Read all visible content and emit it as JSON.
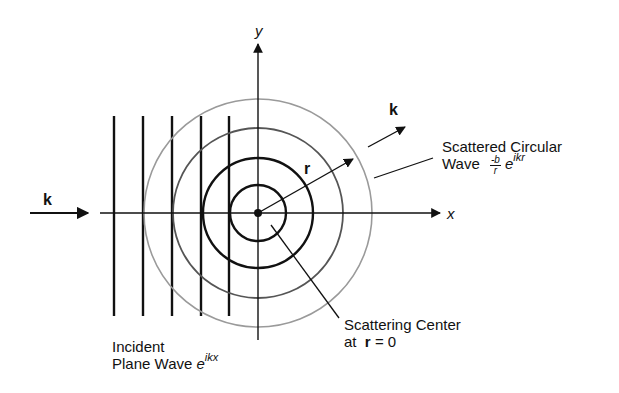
{
  "diagram": {
    "axes": {
      "x_label": "x",
      "y_label": "y"
    },
    "incident_wave": {
      "wavevector_label": "k",
      "label_line1": "Incident",
      "label_line2": "Plane Wave",
      "expression_base": "e",
      "expression_exponent": "ikx"
    },
    "scattered_wave": {
      "wavevector_label": "k",
      "label_line1": "Scattered Circular",
      "label_line2": "Wave",
      "fraction_numerator": "-b",
      "fraction_denominator": "r",
      "expression_base": "e",
      "expression_exponent": "ikr"
    },
    "radius_label": "r",
    "scattering_center": {
      "label_line1": "Scattering Center",
      "label_line2_prefix": "at",
      "label_line2_vector": "r",
      "label_line2_suffix": "= 0"
    },
    "geometry": {
      "center": [
        258,
        213
      ],
      "circle_radii": [
        28,
        55,
        85,
        114
      ],
      "plane_wavefront_x": [
        114,
        143,
        172,
        201,
        229
      ],
      "colors": {
        "ink": "#111111",
        "faint": "#9a9a9a"
      }
    }
  }
}
